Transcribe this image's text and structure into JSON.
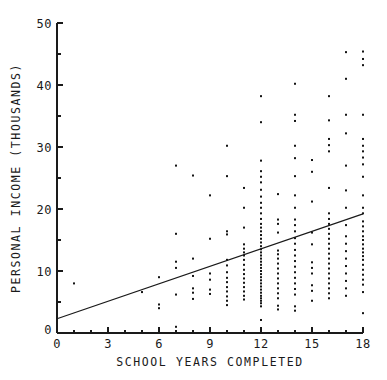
{
  "chart_data": {
    "type": "scatter",
    "title": "",
    "xlabel": "SCHOOL YEARS COMPLETED",
    "ylabel": "PERSONAL INCOME (THOUSANDS)",
    "xlim": [
      0,
      18
    ],
    "ylim": [
      0,
      50
    ],
    "xticks": [
      0,
      3,
      6,
      9,
      12,
      15,
      18
    ],
    "xtick_labels": [
      "0",
      "3",
      "6",
      "9",
      "12",
      "15",
      "18"
    ],
    "yticks": [
      0,
      10,
      20,
      30,
      40,
      50
    ],
    "ytick_labels": [
      "0",
      "10",
      "20",
      "30",
      "40",
      "50"
    ],
    "x_minor_tick_step": 1,
    "y_minor_tick_step": 5,
    "grid": false,
    "legend": null,
    "marker": "square-dot",
    "marker_size_px": 2,
    "marker_color": "#141414",
    "series": [
      {
        "name": "observations",
        "points": [
          [
            1,
            8.0
          ],
          [
            5,
            6.6
          ],
          [
            6,
            9.0
          ],
          [
            6,
            4.6
          ],
          [
            6,
            4.0
          ],
          [
            7,
            27.0
          ],
          [
            7,
            16.0
          ],
          [
            7,
            11.5
          ],
          [
            7,
            10.5
          ],
          [
            7,
            6.2
          ],
          [
            7,
            1.0
          ],
          [
            8,
            25.4
          ],
          [
            8,
            12.0
          ],
          [
            8,
            9.2
          ],
          [
            8,
            7.2
          ],
          [
            8,
            6.5
          ],
          [
            8,
            5.5
          ],
          [
            9,
            22.2
          ],
          [
            9,
            15.2
          ],
          [
            9,
            9.6
          ],
          [
            9,
            8.6
          ],
          [
            9,
            7.0
          ],
          [
            9,
            6.3
          ],
          [
            10,
            30.2
          ],
          [
            10,
            25.3
          ],
          [
            10,
            16.4
          ],
          [
            10,
            15.9
          ],
          [
            10,
            11.8
          ],
          [
            10,
            10.9
          ],
          [
            10,
            9.8
          ],
          [
            10,
            8.9
          ],
          [
            10,
            8.2
          ],
          [
            10,
            7.4
          ],
          [
            10,
            6.7
          ],
          [
            10,
            5.9
          ],
          [
            10,
            5.2
          ],
          [
            10,
            4.5
          ],
          [
            11,
            23.4
          ],
          [
            11,
            20.2
          ],
          [
            11,
            17.0
          ],
          [
            11,
            14.3
          ],
          [
            11,
            13.6
          ],
          [
            11,
            13.0
          ],
          [
            11,
            12.5
          ],
          [
            11,
            11.8
          ],
          [
            11,
            11.0
          ],
          [
            11,
            10.2
          ],
          [
            11,
            9.5
          ],
          [
            11,
            8.8
          ],
          [
            11,
            8.1
          ],
          [
            11,
            7.4
          ],
          [
            11,
            6.7
          ],
          [
            11,
            6.0
          ],
          [
            11,
            5.4
          ],
          [
            12,
            38.2
          ],
          [
            12,
            34.0
          ],
          [
            12,
            27.8
          ],
          [
            12,
            26.1
          ],
          [
            12,
            25.2
          ],
          [
            12,
            24.3
          ],
          [
            12,
            23.1
          ],
          [
            12,
            22.0
          ],
          [
            12,
            21.0
          ],
          [
            12,
            20.2
          ],
          [
            12,
            19.3
          ],
          [
            12,
            18.4
          ],
          [
            12,
            17.6
          ],
          [
            12,
            17.0
          ],
          [
            12,
            16.4
          ],
          [
            12,
            15.8
          ],
          [
            12,
            15.2
          ],
          [
            12,
            14.6
          ],
          [
            12,
            14.0
          ],
          [
            12,
            13.5
          ],
          [
            12,
            13.0
          ],
          [
            12,
            12.5
          ],
          [
            12,
            12.0
          ],
          [
            12,
            11.5
          ],
          [
            12,
            11.0
          ],
          [
            12,
            10.5
          ],
          [
            12,
            10.0
          ],
          [
            12,
            9.5
          ],
          [
            12,
            9.0
          ],
          [
            12,
            8.5
          ],
          [
            12,
            8.0
          ],
          [
            12,
            7.5
          ],
          [
            12,
            7.0
          ],
          [
            12,
            6.5
          ],
          [
            12,
            6.0
          ],
          [
            12,
            5.6
          ],
          [
            12,
            5.2
          ],
          [
            12,
            4.8
          ],
          [
            12,
            4.3
          ],
          [
            12,
            2.1
          ],
          [
            12,
            0.4
          ],
          [
            13,
            22.4
          ],
          [
            13,
            18.3
          ],
          [
            13,
            17.6
          ],
          [
            13,
            16.2
          ],
          [
            13,
            13.3
          ],
          [
            13,
            12.7
          ],
          [
            13,
            12.0
          ],
          [
            13,
            11.2
          ],
          [
            13,
            10.4
          ],
          [
            13,
            9.6
          ],
          [
            13,
            8.8
          ],
          [
            13,
            8.0
          ],
          [
            13,
            7.2
          ],
          [
            13,
            6.4
          ],
          [
            13,
            5.6
          ],
          [
            13,
            4.4
          ],
          [
            13,
            3.8
          ],
          [
            14,
            40.2
          ],
          [
            14,
            35.2
          ],
          [
            14,
            34.2
          ],
          [
            14,
            30.2
          ],
          [
            14,
            28.2
          ],
          [
            14,
            25.3
          ],
          [
            14,
            22.2
          ],
          [
            14,
            20.2
          ],
          [
            14,
            18.3
          ],
          [
            14,
            17.4
          ],
          [
            14,
            16.4
          ],
          [
            14,
            15.3
          ],
          [
            14,
            14.4
          ],
          [
            14,
            13.4
          ],
          [
            14,
            12.5
          ],
          [
            14,
            11.6
          ],
          [
            14,
            10.7
          ],
          [
            14,
            9.8
          ],
          [
            14,
            8.9
          ],
          [
            14,
            8.0
          ],
          [
            14,
            7.1
          ],
          [
            14,
            6.2
          ],
          [
            14,
            4.3
          ],
          [
            14,
            3.6
          ],
          [
            15,
            27.9
          ],
          [
            15,
            26.0
          ],
          [
            15,
            21.2
          ],
          [
            15,
            16.2
          ],
          [
            15,
            14.3
          ],
          [
            15,
            11.4
          ],
          [
            15,
            10.5
          ],
          [
            15,
            9.6
          ],
          [
            15,
            7.7
          ],
          [
            15,
            6.8
          ],
          [
            15,
            5.2
          ],
          [
            16,
            38.2
          ],
          [
            16,
            34.3
          ],
          [
            16,
            31.3
          ],
          [
            16,
            30.3
          ],
          [
            16,
            29.3
          ],
          [
            16,
            23.4
          ],
          [
            16,
            19.3
          ],
          [
            16,
            18.4
          ],
          [
            16,
            17.6
          ],
          [
            16,
            16.8
          ],
          [
            16,
            16.0
          ],
          [
            16,
            15.2
          ],
          [
            16,
            14.4
          ],
          [
            16,
            13.6
          ],
          [
            16,
            12.8
          ],
          [
            16,
            12.0
          ],
          [
            16,
            11.2
          ],
          [
            16,
            10.4
          ],
          [
            16,
            9.6
          ],
          [
            16,
            8.8
          ],
          [
            16,
            8.0
          ],
          [
            16,
            7.2
          ],
          [
            16,
            6.4
          ],
          [
            16,
            5.6
          ],
          [
            17,
            45.3
          ],
          [
            17,
            41.0
          ],
          [
            17,
            35.2
          ],
          [
            17,
            32.2
          ],
          [
            17,
            27.0
          ],
          [
            17,
            23.0
          ],
          [
            17,
            20.2
          ],
          [
            17,
            17.4
          ],
          [
            17,
            15.6
          ],
          [
            17,
            14.4
          ],
          [
            17,
            13.2
          ],
          [
            17,
            12.0
          ],
          [
            17,
            10.8
          ],
          [
            17,
            9.6
          ],
          [
            17,
            8.4
          ],
          [
            17,
            7.2
          ],
          [
            17,
            6.0
          ],
          [
            18,
            45.4
          ],
          [
            18,
            44.2
          ],
          [
            18,
            43.2
          ],
          [
            18,
            35.2
          ],
          [
            18,
            31.3
          ],
          [
            18,
            30.2
          ],
          [
            18,
            29.3
          ],
          [
            18,
            28.3
          ],
          [
            18,
            27.2
          ],
          [
            18,
            25.2
          ],
          [
            18,
            22.2
          ],
          [
            18,
            20.2
          ],
          [
            18,
            19.3
          ],
          [
            18,
            18.0
          ],
          [
            18,
            17.2
          ],
          [
            18,
            16.4
          ],
          [
            18,
            15.6
          ],
          [
            18,
            15.0
          ],
          [
            18,
            14.3
          ],
          [
            18,
            13.6
          ],
          [
            18,
            13.0
          ],
          [
            18,
            12.4
          ],
          [
            18,
            11.8
          ],
          [
            18,
            11.0
          ],
          [
            18,
            10.2
          ],
          [
            18,
            9.4
          ],
          [
            18,
            8.6
          ],
          [
            18,
            7.8
          ],
          [
            18,
            6.6
          ],
          [
            18,
            3.2
          ]
        ]
      }
    ],
    "fit_line": {
      "name": "least-squares regression line",
      "x_start": 0,
      "y_start": 2.3,
      "x_end": 18,
      "y_end": 19.2
    }
  },
  "geometry": {
    "plot_left": 57,
    "plot_right": 363,
    "plot_top": 23,
    "plot_bottom": 333
  }
}
